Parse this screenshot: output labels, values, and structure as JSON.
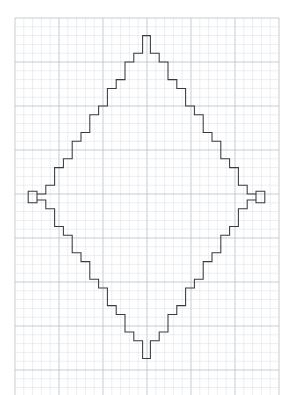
{
  "document": {
    "title": "Graph-paper chart",
    "subject": "symmetric stepped diamond motif",
    "background_color": "#ffffff",
    "width": 292,
    "height": 395
  },
  "paper": {
    "name": "graph-paper",
    "cell_px": 8.8,
    "major_every": 5,
    "minor_line_color": "#d9dde3",
    "major_line_color": "#b9c0c8",
    "minor_line_width": 0.5,
    "major_line_width": 0.8,
    "origin_x": 15,
    "origin_y": 18,
    "cols": 30,
    "rows": 43
  },
  "motif": {
    "name": "stepped-diamond",
    "stroke_color": "#3b3b3f",
    "stroke_width": 1.05,
    "fill": "none",
    "description": "Closed orthogonal outline forming a rhombus with three zigzag peaks on the top edge and three mirrored peaks on the bottom edge.",
    "bounds_px": {
      "left": 28,
      "top": 27,
      "right": 265,
      "bottom": 367
    },
    "symmetry": "horizontal and vertical mirror",
    "peak_count_top": 3,
    "peak_count_bottom": 3,
    "unit_cell_px": 8.8,
    "grid_origin_x": 15,
    "grid_origin_y": 18,
    "top_outline_cells": [
      [
        1.5,
        21.5
      ],
      [
        1.5,
        20.5
      ],
      [
        2.5,
        20.5
      ],
      [
        2.5,
        19.5
      ],
      [
        3.5,
        19.5
      ],
      [
        3.5,
        17.5
      ],
      [
        4.5,
        17.5
      ],
      [
        4.5,
        16.5
      ],
      [
        5.5,
        16.5
      ],
      [
        5.5,
        14.5
      ],
      [
        6.5,
        14.5
      ],
      [
        6.5,
        13.5
      ],
      [
        7.5,
        13.5
      ],
      [
        7.5,
        11.5
      ],
      [
        8.5,
        11.5
      ],
      [
        8.5,
        10.5
      ],
      [
        9.5,
        10.5
      ],
      [
        9.5,
        8.5
      ],
      [
        10.5,
        8.5
      ],
      [
        10.5,
        7.5
      ],
      [
        11.5,
        7.5
      ],
      [
        11.5,
        5.5
      ],
      [
        12.5,
        5.5
      ],
      [
        12.5,
        4.5
      ],
      [
        13.5,
        4.5
      ],
      [
        13.5,
        2.5
      ],
      [
        14.5,
        2.5
      ],
      [
        14.5,
        1.0
      ],
      [
        15.5,
        1.0
      ],
      [
        15.5,
        2.5
      ],
      [
        16.5,
        2.5
      ],
      [
        16.5,
        4.5
      ],
      [
        17.5,
        4.5
      ],
      [
        17.5,
        5.5
      ],
      [
        18.5,
        5.5
      ],
      [
        18.5,
        7.5
      ],
      [
        19.5,
        7.5
      ],
      [
        19.5,
        6.0
      ],
      [
        20.5,
        6.0
      ],
      [
        20.5,
        4.5
      ],
      [
        21.5,
        4.5
      ],
      [
        21.5,
        2.5
      ],
      [
        22.5,
        2.5
      ],
      [
        22.5,
        1.0
      ],
      [
        23.5,
        1.0
      ],
      [
        23.5,
        2.5
      ],
      [
        24.5,
        2.5
      ],
      [
        24.5,
        4.5
      ],
      [
        25.5,
        4.5
      ],
      [
        25.5,
        5.5
      ],
      [
        26.5,
        5.5
      ],
      [
        26.5,
        7.5
      ],
      [
        27.5,
        7.5
      ],
      [
        27.5,
        6.0
      ],
      [
        28.5,
        6.0
      ]
    ],
    "note": "Coordinates listed in grid-cell units relative to the paper origin; the rendering script mirrors the top profile to build the left, right and bottom edges."
  },
  "profile": {
    "name": "half-peak-profile",
    "comment": "Heights (in cells, measured down from the motif top) of the 15 columns spanning the left half of the top edge, from the left vertex to the centre. The full outline is generated by mirroring this profile four ways.",
    "stair_cells": [
      21,
      20,
      19,
      17,
      16,
      14,
      13,
      11,
      10,
      8,
      7,
      5,
      4,
      2,
      1
    ],
    "peak_pattern": [
      1,
      2,
      4,
      5,
      7,
      6,
      4,
      2,
      1
    ]
  }
}
